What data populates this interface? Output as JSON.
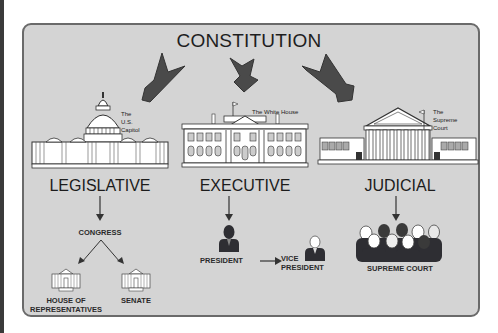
{
  "diagram": {
    "title": "CONSTITUTION",
    "branches": [
      {
        "name": "LEGISLATIVE",
        "building_label": [
          "The",
          "U.S.",
          "Capitol"
        ],
        "body": "CONGRESS",
        "sub_bodies": [
          {
            "label_line1": "HOUSE OF",
            "label_line2": "REPRESENTATIVES"
          },
          {
            "label_line1": "SENATE",
            "label_line2": ""
          }
        ]
      },
      {
        "name": "EXECUTIVE",
        "building_label": [
          "The White House"
        ],
        "roles": [
          {
            "label_line1": "PRESIDENT",
            "label_line2": ""
          },
          {
            "label_line1": "VICE",
            "label_line2": "PRESIDENT"
          }
        ]
      },
      {
        "name": "JUDICIAL",
        "building_label": [
          "The",
          "Supreme",
          "Court"
        ],
        "body": "SUPREME COURT"
      }
    ],
    "colors": {
      "panel_bg": "#d4d4d4",
      "panel_border": "#6a6a6a",
      "arrow_fill": "#4a4a4a",
      "text": "#1e1e1e",
      "figure_dark": "#2e2e33"
    }
  }
}
